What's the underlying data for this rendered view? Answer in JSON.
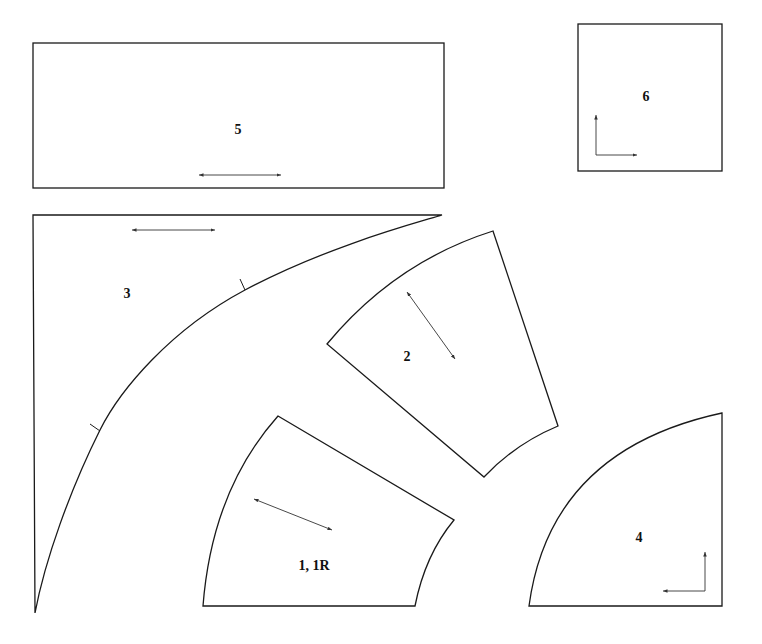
{
  "diagram": {
    "type": "sewing-pattern-layout",
    "pieces": [
      {
        "id": "5",
        "label": "5",
        "shape": "rectangle",
        "grainline": "horizontal"
      },
      {
        "id": "6",
        "label": "6",
        "shape": "square",
        "grainline": "L-shaped (up and right)"
      },
      {
        "id": "3",
        "label": "3",
        "shape": "quarter-circle corner with concave curve",
        "grainline": "horizontal",
        "notches": 2
      },
      {
        "id": "2",
        "label": "2",
        "shape": "curved wedge segment",
        "grainline": "diagonal"
      },
      {
        "id": "1",
        "label": "1, 1R",
        "shape": "curved wedge segment",
        "grainline": "diagonal"
      },
      {
        "id": "4",
        "label": "4",
        "shape": "quarter circle",
        "grainline": "L-shaped (up and left)"
      }
    ],
    "colors": {
      "line": "#1a1a1a",
      "background": "#ffffff"
    }
  }
}
